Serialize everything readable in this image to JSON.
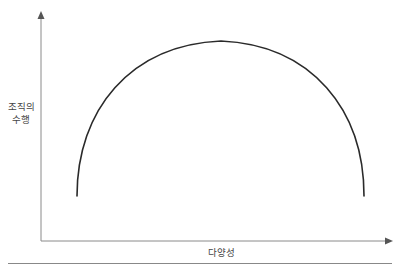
{
  "diagram": {
    "y_axis": {
      "label_line1": "조직의",
      "label_line2": "수행"
    },
    "x_axis": {
      "label": "다양성"
    },
    "curve": {
      "shape": "inverted-u",
      "description": "Organizational performance rises with diversity to a peak at moderate diversity, then falls",
      "start": {
        "x": 77,
        "y": 196
      },
      "peak": {
        "x": 221,
        "y": 41
      },
      "end": {
        "x": 364,
        "y": 196
      }
    },
    "colors": {
      "axis": "#8a8a8a",
      "curve": "#2a2a2a",
      "text": "#444444",
      "rule": "#888888"
    }
  }
}
